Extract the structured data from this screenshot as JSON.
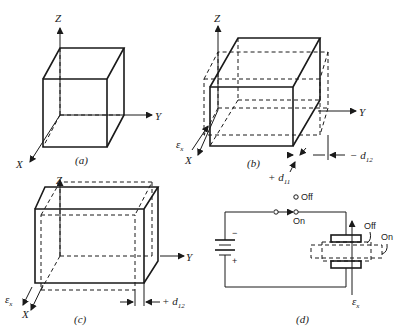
{
  "figure": {
    "panels": [
      {
        "id": "a",
        "caption": "(a)",
        "description": "Undeformed cube with axes X, Y, Z"
      },
      {
        "id": "b",
        "caption": "(b)",
        "description": "Cube deformed under field along X: expands +d11 in X, contracts -d12 in Y"
      },
      {
        "id": "c",
        "caption": "(c)",
        "description": "Cube deformed under field along -X: contracts in X, expands +d12 in Y"
      },
      {
        "id": "d",
        "caption": "(d)",
        "description": "Battery circuit with switch applying field to piezoelectric element"
      }
    ],
    "axes": {
      "x": "X",
      "y": "Y",
      "z": "Z"
    },
    "field_label": "ε",
    "field_sub": "x",
    "labels": {
      "plus_d11": "+ d",
      "plus_d11_sub": "11",
      "minus_d12": "− d",
      "minus_d12_sub": "12",
      "plus_d12": "+ d",
      "plus_d12_sub": "12"
    },
    "circuit": {
      "switch_off": "Off",
      "switch_on": "On",
      "element_off": "Off",
      "element_on": "On",
      "battery_minus": "−",
      "battery_plus": "+"
    }
  }
}
